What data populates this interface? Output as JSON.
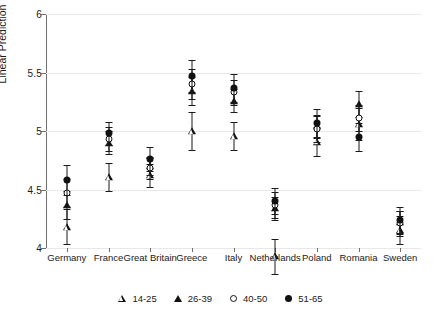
{
  "chart_data": {
    "type": "scatter",
    "title": "",
    "xlabel": "",
    "ylabel": "Linear Prediction",
    "ylim": [
      4,
      6
    ],
    "yticks": [
      4,
      4.5,
      5,
      5.5,
      6
    ],
    "ytick_labels": [
      "4",
      "4.5",
      "5",
      "5.5",
      "6"
    ],
    "grid": true,
    "legend_position": "bottom",
    "error_bars": "95% confidence interval",
    "categories": [
      "Germany",
      "France",
      "Great Britain",
      "Greece",
      "Italy",
      "Netherlands",
      "Poland",
      "Romania",
      "Sweden"
    ],
    "series": [
      {
        "name": "14-25",
        "marker": "triangle-hollow",
        "values": [
          4.18,
          4.61,
          4.62,
          5.0,
          4.96,
          3.93,
          4.91,
          5.06,
          4.15
        ],
        "ci_low": [
          4.03,
          4.49,
          4.52,
          4.84,
          4.84,
          3.78,
          4.79,
          4.92,
          4.03
        ],
        "ci_high": [
          4.33,
          4.73,
          4.72,
          5.16,
          5.08,
          4.08,
          5.03,
          5.2,
          4.27
        ]
      },
      {
        "name": "26-39",
        "marker": "triangle-filled",
        "values": [
          4.37,
          4.9,
          4.7,
          5.34,
          5.26,
          4.34,
          5.04,
          5.23,
          4.22
        ],
        "ci_low": [
          4.25,
          4.8,
          4.62,
          5.22,
          5.16,
          4.24,
          4.94,
          5.12,
          4.12
        ],
        "ci_high": [
          4.49,
          5.0,
          4.78,
          5.46,
          5.36,
          4.44,
          5.14,
          5.34,
          4.32
        ]
      },
      {
        "name": "40-50",
        "marker": "circle-hollow",
        "values": [
          4.47,
          4.93,
          4.68,
          5.4,
          5.33,
          4.37,
          5.02,
          5.11,
          4.21
        ],
        "ci_low": [
          4.35,
          4.83,
          4.59,
          5.27,
          5.22,
          4.26,
          4.91,
          5.0,
          4.1
        ],
        "ci_high": [
          4.59,
          5.03,
          4.77,
          5.53,
          5.44,
          4.48,
          5.13,
          5.22,
          4.32
        ]
      },
      {
        "name": "51-65",
        "marker": "circle-filled",
        "values": [
          4.58,
          4.98,
          4.76,
          5.47,
          5.37,
          4.4,
          5.07,
          4.95,
          4.24
        ],
        "ci_low": [
          4.45,
          4.88,
          4.66,
          5.33,
          5.25,
          4.29,
          4.95,
          4.83,
          4.13
        ],
        "ci_high": [
          4.71,
          5.08,
          4.86,
          5.61,
          5.49,
          4.51,
          5.19,
          5.07,
          4.35
        ]
      }
    ],
    "legend": [
      {
        "label": "14-25",
        "marker": "triangle-hollow"
      },
      {
        "label": "26-39",
        "marker": "triangle-filled"
      },
      {
        "label": "40-50",
        "marker": "circle-hollow"
      },
      {
        "label": "51-65",
        "marker": "circle-filled"
      }
    ]
  }
}
